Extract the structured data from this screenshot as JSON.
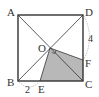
{
  "diagram": {
    "type": "geometry",
    "shape": "square ABCD with diagonals AC and BD intersecting at O",
    "points": {
      "A": {
        "label": "A",
        "x": 18,
        "y": 15
      },
      "B": {
        "label": "B",
        "x": 18,
        "y": 81
      },
      "C": {
        "label": "C",
        "x": 83,
        "y": 81
      },
      "D": {
        "label": "D",
        "x": 83,
        "y": 15
      },
      "O": {
        "label": "O",
        "x": 50,
        "y": 48
      },
      "E": {
        "label": "E",
        "x": 40,
        "y": 81
      },
      "F": {
        "label": "F",
        "x": 83,
        "y": 60
      }
    },
    "measurements": {
      "BE": "2",
      "DF": "4"
    },
    "shaded_region": "OECF",
    "colors": {
      "line": "#333333",
      "shade": "#b8b8b8",
      "arc": "#999999"
    }
  }
}
